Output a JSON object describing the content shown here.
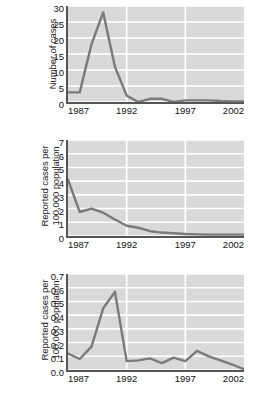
{
  "chart_data": [
    {
      "type": "line",
      "panel_index": 0,
      "title": "",
      "xlabel": "",
      "ylabel": "Number of cases",
      "ylabel_lines": [
        "Number of cases"
      ],
      "xlim": [
        1987,
        2002
      ],
      "ylim": [
        0,
        30
      ],
      "yticks": [
        0,
        5,
        10,
        15,
        20,
        25,
        30
      ],
      "ytick_labels": [
        "0",
        "5",
        "10",
        "15",
        "20",
        "25",
        "30"
      ],
      "xticks": [
        1987,
        1992,
        1997,
        2002
      ],
      "xtick_labels": [
        "1987",
        "1992",
        "1997",
        "2002"
      ],
      "grid": true,
      "grid_color": "#ffffff",
      "plot_bg": "#d9d9d9",
      "line_color": "#7a7a7a",
      "x": [
        1987,
        1988,
        1989,
        1990,
        1991,
        1992,
        1993,
        1994,
        1995,
        1996,
        1997,
        1998,
        1999,
        2000,
        2001,
        2002
      ],
      "values": [
        3,
        3,
        18,
        28,
        11,
        2,
        0,
        1,
        1,
        0,
        0.5,
        0.5,
        0.5,
        0.3,
        0.2,
        0.2
      ]
    },
    {
      "type": "line",
      "panel_index": 1,
      "title": "",
      "xlabel": "",
      "ylabel": "Reported cases per 100,000 population",
      "ylabel_lines": [
        "Reported cases per",
        "100,000 population"
      ],
      "xlim": [
        1987,
        2002
      ],
      "ylim": [
        0,
        7
      ],
      "yticks": [
        0,
        1,
        2,
        3,
        4,
        5,
        6,
        7
      ],
      "ytick_labels": [
        "0",
        "1",
        "2",
        "3",
        "4",
        "5",
        "6",
        "7"
      ],
      "xticks": [
        1987,
        1992,
        1997,
        2002
      ],
      "xtick_labels": [
        "1987",
        "1992",
        "1997",
        "2002"
      ],
      "grid": true,
      "grid_color": "#ffffff",
      "plot_bg": "#d9d9d9",
      "line_color": "#7a7a7a",
      "x": [
        1987,
        1988,
        1989,
        1990,
        1991,
        1992,
        1993,
        1994,
        1995,
        1996,
        1997,
        1998,
        1999,
        2000,
        2001,
        2002
      ],
      "values": [
        4.1,
        1.75,
        2.0,
        1.7,
        1.2,
        0.75,
        0.6,
        0.35,
        0.25,
        0.2,
        0.15,
        0.12,
        0.1,
        0.1,
        0.1,
        0.1
      ]
    },
    {
      "type": "line",
      "panel_index": 2,
      "title": "",
      "xlabel": "",
      "ylabel": "Reported cases per 100,000 population",
      "ylabel_lines": [
        "Reported cases per",
        "100,000 population"
      ],
      "xlim": [
        1987,
        2002
      ],
      "ylim": [
        0.0,
        0.7
      ],
      "yticks": [
        0.0,
        0.1,
        0.2,
        0.3,
        0.4,
        0.5,
        0.6,
        0.7
      ],
      "ytick_labels": [
        "0.0",
        "0.1",
        "0.2",
        "0.3",
        "0.4",
        "0.5",
        "0.6",
        "0.7"
      ],
      "xticks": [
        1987,
        1992,
        1997,
        2002
      ],
      "xtick_labels": [
        "1987",
        "1992",
        "1997",
        "2002"
      ],
      "grid": true,
      "grid_color": "#ffffff",
      "plot_bg": "#d9d9d9",
      "line_color": "#7a7a7a",
      "x": [
        1987,
        1988,
        1989,
        1990,
        1991,
        1992,
        1993,
        1994,
        1995,
        1996,
        1997,
        1998,
        1999,
        2000,
        2001,
        2002
      ],
      "values": [
        0.12,
        0.08,
        0.17,
        0.45,
        0.57,
        0.065,
        0.07,
        0.085,
        0.05,
        0.09,
        0.065,
        0.14,
        0.1,
        0.07,
        0.04,
        0.005
      ]
    }
  ]
}
